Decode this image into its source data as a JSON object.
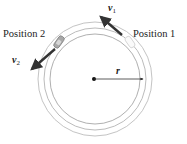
{
  "diagram": {
    "labels": {
      "position_1": "Position 1",
      "position_2": "Position 2",
      "v1_symbol": "v",
      "v1_subscript": "1",
      "v2_symbol": "v",
      "v2_subscript": "2",
      "radius": "r"
    },
    "track": {
      "center": [
        95,
        79
      ],
      "radii": [
        57,
        51,
        45
      ],
      "stroke_color": "#b8b8b8"
    },
    "colors": {
      "arrow": "#333333",
      "text": "#222222",
      "car_fill": "#9a9a9a"
    }
  }
}
